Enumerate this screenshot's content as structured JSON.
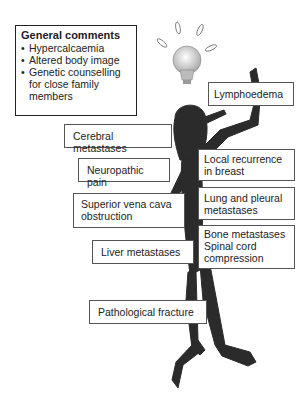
{
  "general_comments": {
    "title": "General comments",
    "bullet": "•",
    "items": [
      "Hypercalcaemia",
      "Altered body image",
      "Genetic counselling",
      "for close family",
      "members"
    ]
  },
  "labels": {
    "lymphoedema": "Lymphoedema",
    "cerebral": "Cerebral metastases",
    "neuropathic": "Neuropathic pain",
    "local_recurrence_1": "Local recurrence",
    "local_recurrence_2": "in breast",
    "svc_1": "Superior vena cava",
    "svc_2": "obstruction",
    "lung_1": "Lung and pleural",
    "lung_2": "metastases",
    "liver": "Liver metastases",
    "bone_1": "Bone metastases",
    "bone_2": "Spinal cord",
    "bone_3": "compression",
    "fracture": "Pathological fracture"
  },
  "icons": {
    "lightbulb": "lightbulb-icon",
    "figure": "stick-figure"
  },
  "colors": {
    "figure": "#2b2b2b",
    "bulb": "#d8d8d8",
    "border": "#555555"
  }
}
